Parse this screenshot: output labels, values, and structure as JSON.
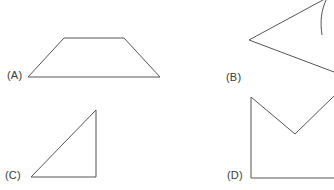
{
  "canvas": {
    "width": 334,
    "height": 190,
    "background_color": "#ffffff",
    "stroke_color": "#555555",
    "stroke_width": 1
  },
  "options": [
    {
      "id": "a",
      "label": "(A)",
      "shape_name": "trapezoid",
      "closed": true,
      "clipped": false,
      "points": "28,77 64,38 124,38 160,77"
    },
    {
      "id": "b",
      "label": "(B)",
      "shape_name": "triangle-pointing-left",
      "closed": false,
      "clipped": true,
      "points": "334,-6 249,40 334,72"
    },
    {
      "id": "c",
      "label": "(C)",
      "shape_name": "right-triangle",
      "closed": true,
      "clipped": false,
      "points": "96,110 96,177 31,177"
    },
    {
      "id": "d",
      "label": "(D)",
      "shape_name": "concave-notched-polygon",
      "closed": false,
      "clipped": true,
      "points": "334,178 251,178 251,97 295,134 334,96"
    }
  ],
  "partial_shape": {
    "shape_name": "clipped-curve-right-edge",
    "path": "M 327,-2 C 321,10 320,22 322,35"
  }
}
